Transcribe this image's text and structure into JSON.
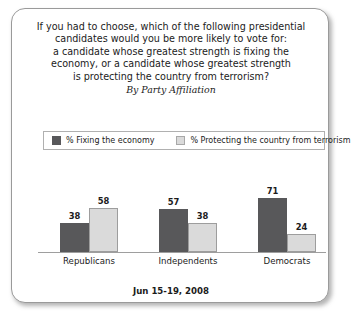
{
  "card": {
    "title_lines": [
      "If you had to choose, which of the following presidential",
      "candidates would you be more likely to vote for:",
      "a candidate whose greatest strength is fixing the",
      "economy, or a candidate whose greatest strength",
      "is protecting the country from terrorism?"
    ],
    "subtitle": "By Party Affiliation",
    "footer_date": "Jun 15-19, 2008"
  },
  "legend": {
    "items": [
      {
        "label": "% Fixing the economy",
        "color": "#58585a",
        "swatch": "dark-swatch"
      },
      {
        "label": "% Protecting the country from terrorism",
        "color": "#dadada",
        "swatch": "light-swatch"
      }
    ]
  },
  "chart_data": {
    "type": "bar",
    "subtitle": "By Party Affiliation",
    "xlabel": "",
    "ylabel": "",
    "ylim": [
      0,
      100
    ],
    "grid": false,
    "legend_position": "top",
    "categories": [
      "Republicans",
      "Independents",
      "Democrats"
    ],
    "series": [
      {
        "name": "% Fixing the economy",
        "color": "#58585a",
        "values": [
          38,
          57,
          71
        ]
      },
      {
        "name": "% Protecting the country from terrorism",
        "color": "#dadada",
        "values": [
          58,
          38,
          24
        ]
      }
    ],
    "annotations": {
      "footer": "Jun 15-19, 2008"
    }
  }
}
